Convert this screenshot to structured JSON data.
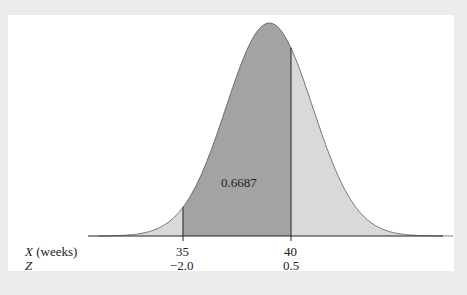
{
  "chart_data": {
    "type": "area",
    "title": "",
    "distribution": "normal",
    "mean": 39,
    "sd": 2,
    "xlabel": "X (weeks)",
    "zlabel": "Z",
    "ticks": [
      {
        "x": 35,
        "z": "-2.0",
        "x_label": "35",
        "z_label": "−2.0"
      },
      {
        "x": 40,
        "z": "0.5",
        "x_label": "40",
        "z_label": "0.5"
      }
    ],
    "shaded_region": {
      "from": 35,
      "to": 40,
      "area": 0.6687,
      "label": "0.6687"
    },
    "colors": {
      "shaded": "#a3a3a3",
      "unshaded": "#d9d9d9",
      "background": "#ececec",
      "panel": "#ffffff"
    }
  },
  "labels": {
    "area": "0.6687",
    "x_axis": "X (weeks)",
    "z_axis": "Z",
    "x35": "35",
    "x40": "40",
    "z35": "−2.0",
    "z40": "0.5"
  }
}
